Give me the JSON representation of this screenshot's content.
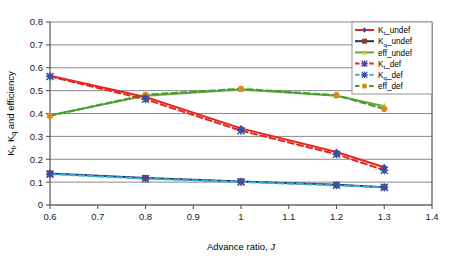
{
  "chart_data": {
    "type": "line",
    "title": "",
    "xlabel": "Advance ratio, J",
    "ylabel": "Kt, Kq and efficiency",
    "ylabel_parts": {
      "k": "K",
      "t": "t",
      "sep": ", ",
      "k2": "K",
      "q": "q",
      "tail": " and efficiency"
    },
    "xlabel_parts": {
      "text": "Advance ratio, ",
      "italic": "J"
    },
    "x": [
      0.6,
      0.8,
      1.0,
      1.2,
      1.3
    ],
    "xlim": [
      0.6,
      1.4
    ],
    "ylim": [
      0,
      0.8
    ],
    "xticks": [
      "0.6",
      "0.7",
      "0.8",
      "0.9",
      "1",
      "1.1",
      "1.2",
      "1.3",
      "1.4"
    ],
    "xtick_values": [
      0.6,
      0.7,
      0.8,
      0.9,
      1.0,
      1.1,
      1.2,
      1.3,
      1.4
    ],
    "yticks": [
      "0",
      "0.1",
      "0.2",
      "0.3",
      "0.4",
      "0.5",
      "0.6",
      "0.7",
      "0.8"
    ],
    "ytick_values": [
      0,
      0.1,
      0.2,
      0.3,
      0.4,
      0.5,
      0.6,
      0.7,
      0.8
    ],
    "grid": "horizontal",
    "legend_position": "top-right",
    "series": [
      {
        "name": "Kt_undef",
        "label_main": "K",
        "label_sub": "t",
        "label_tail": "_undef",
        "color": "#e8251c",
        "marker_color": "#3b4fa0",
        "marker": "diamond",
        "dash": "solid",
        "values": [
          0.565,
          0.472,
          0.335,
          0.232,
          0.165
        ]
      },
      {
        "name": "Kq_undef",
        "label_main": "K",
        "label_sub": "q",
        "label_tail": "_undef",
        "color": "#1f2f6e",
        "marker_color": "#8f3a24",
        "marker": "square",
        "dash": "solid",
        "values": [
          0.138,
          0.118,
          0.103,
          0.088,
          0.078
        ]
      },
      {
        "name": "eff_undef",
        "label_main": "eff_undef",
        "label_sub": "",
        "label_tail": "",
        "color": "#6ea832",
        "marker_color": "#c8c83c",
        "marker": "triangle",
        "dash": "solid",
        "values": [
          0.392,
          0.478,
          0.505,
          0.478,
          0.432
        ]
      },
      {
        "name": "Kt_def",
        "label_main": "K",
        "label_sub": "t",
        "label_tail": "_def",
        "color": "#e8251c",
        "marker_color": "#3b4fa0",
        "marker": "star",
        "dash": "dashed",
        "values": [
          0.562,
          0.462,
          0.325,
          0.222,
          0.152
        ]
      },
      {
        "name": "Kq_def",
        "label_main": "K",
        "label_sub": "q",
        "label_tail": "_def",
        "color": "#36b4d8",
        "marker_color": "#3b4fa0",
        "marker": "star",
        "dash": "dashed",
        "values": [
          0.135,
          0.115,
          0.101,
          0.086,
          0.077
        ]
      },
      {
        "name": "eff_def",
        "label_main": "eff_def",
        "label_sub": "",
        "label_tail": "",
        "color": "#3f9d35",
        "marker_color": "#d98a1e",
        "marker": "circle",
        "dash": "dashed",
        "values": [
          0.39,
          0.482,
          0.508,
          0.48,
          0.42
        ]
      }
    ],
    "colors": {
      "red": "#e8251c",
      "navy": "#1f2f6e",
      "yellow_green": "#6ea832",
      "cyan": "#36b4d8",
      "green": "#3f9d35",
      "orange": "#d98a1e",
      "axis": "#555555",
      "grid": "#6b6b6b"
    }
  }
}
